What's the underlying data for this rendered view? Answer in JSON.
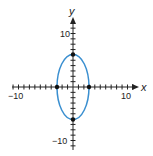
{
  "chart_data": {
    "type": "line",
    "title": "",
    "xlabel": "x",
    "ylabel": "y",
    "xlim": [
      -12,
      12
    ],
    "ylim": [
      -12,
      12
    ],
    "x_tick_labels": [
      "−10",
      "10"
    ],
    "y_tick_labels": [
      "10",
      "−10"
    ],
    "grid": false,
    "series": [
      {
        "name": "ellipse",
        "equation": "x^2/9 + y^2/36 = 1",
        "center": [
          0,
          0
        ],
        "semi_axis_x": 3,
        "semi_axis_y": 6,
        "color": "#3a8fd0"
      }
    ],
    "points": [
      {
        "x": 0,
        "y": 6
      },
      {
        "x": 0,
        "y": -6
      },
      {
        "x": -3,
        "y": 0
      },
      {
        "x": 3,
        "y": 0
      }
    ]
  },
  "labels": {
    "x_axis": "x",
    "y_axis": "y",
    "x_min": "−10",
    "x_max": "10",
    "y_max": "10",
    "y_min": "−10"
  }
}
